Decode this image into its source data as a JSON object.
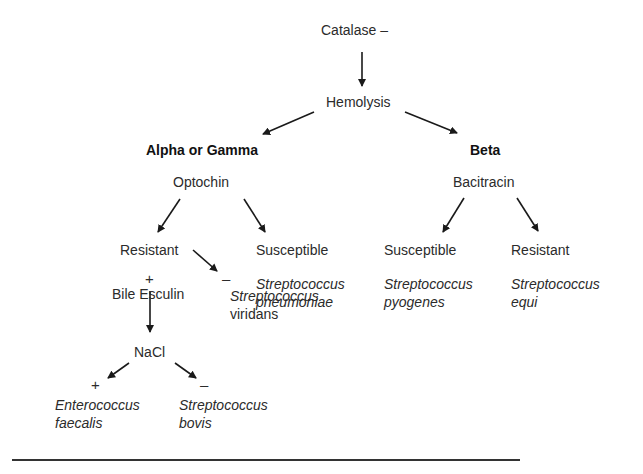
{
  "diagram": {
    "root": {
      "label": "Catalase –"
    },
    "level1": {
      "label": "Hemolysis"
    },
    "branches": {
      "alpha_gamma": {
        "heading": "Alpha or Gamma",
        "test": "Optochin",
        "resistant": {
          "label": "Resistant",
          "test": "Bile Esculin",
          "positive": {
            "sign": "+",
            "test": "NaCl",
            "positive": {
              "sign": "+",
              "organism_line1": "Enterococcus",
              "organism_line2": "faecalis"
            },
            "negative": {
              "sign": "–",
              "organism_line1": "Streptococcus",
              "organism_line2": "bovis"
            }
          },
          "negative": {
            "sign": "–",
            "organism_line1": "Streptococcus",
            "organism_line2": "viridans"
          }
        },
        "susceptible": {
          "label": "Susceptible",
          "organism_line1": "Streptococcus",
          "organism_line2": "pneumoniae"
        }
      },
      "beta": {
        "heading": "Beta",
        "test": "Bacitracin",
        "susceptible": {
          "label": "Susceptible",
          "organism_line1": "Streptococcus",
          "organism_line2": "pyogenes"
        },
        "resistant": {
          "label": "Resistant",
          "organism_line1": "Streptococcus",
          "organism_line2": "equi"
        }
      }
    },
    "colors": {
      "text": "#2b2b2b",
      "arrow": "#1a1a1a",
      "rule": "#333333",
      "background": "#ffffff"
    }
  }
}
